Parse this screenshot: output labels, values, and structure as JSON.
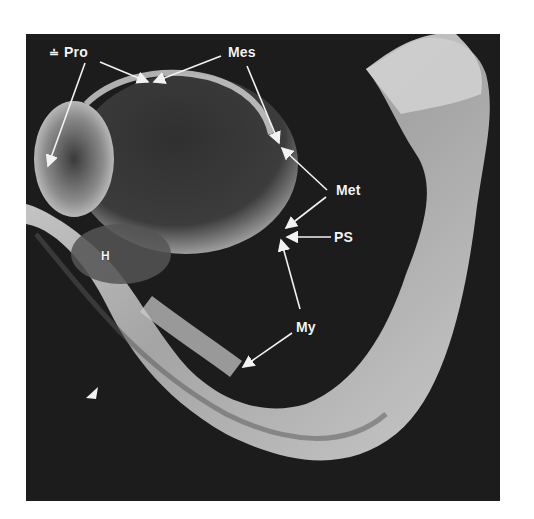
{
  "figure": {
    "type": "scanning electron micrograph",
    "background_color": "#1c1c1c",
    "labels": [
      {
        "id": "pro",
        "text": "Pro",
        "x": 64,
        "y": 44
      },
      {
        "id": "mes",
        "text": "Mes",
        "x": 228,
        "y": 44
      },
      {
        "id": "met",
        "text": "Met",
        "x": 336,
        "y": 182
      },
      {
        "id": "ps",
        "text": "PS",
        "x": 334,
        "y": 229
      },
      {
        "id": "my",
        "text": "My",
        "x": 296,
        "y": 319
      },
      {
        "id": "h",
        "text": "H",
        "x": 101,
        "y": 248
      }
    ],
    "prefix_mark": "≐",
    "arrowhead_marker": {
      "x": 93,
      "y": 393
    }
  }
}
